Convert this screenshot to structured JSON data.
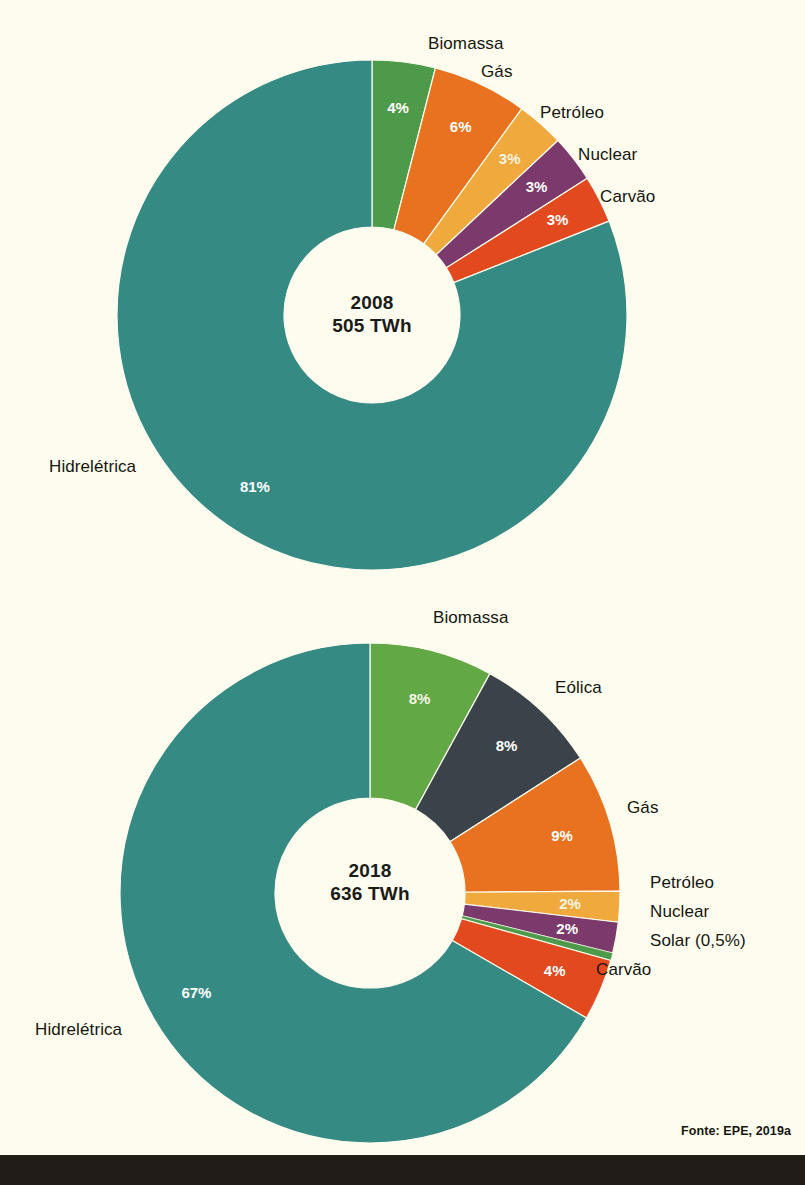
{
  "figure": {
    "background_color": "#fdfcee",
    "bottom_bar_color": "#221c18",
    "source_note": "Fonte: EPE, 2019a"
  },
  "palette": {
    "hidreletrica": "#368a84",
    "biomassa_2008": "#4e9a4b",
    "biomassa_2018": "#62a844",
    "eolica": "#3a424a",
    "gas": "#e8721f",
    "petroleo": "#f0a93c",
    "nuclear": "#7b3a6b",
    "carvao": "#e2491e",
    "solar": "#4e9a4b",
    "label_text": "#16160f",
    "slice_text": "#ffffff",
    "center_text": "#1b1b18"
  },
  "chart_data": [
    {
      "type": "pie",
      "name": "matriz-eletrica-2008",
      "title": "2008",
      "subtitle": "505 TWh",
      "center_lines": [
        "2008",
        "505 TWh"
      ],
      "total_twh": 505,
      "unit": "TWh",
      "donut": true,
      "start_angle_deg": 0,
      "direction": "clockwise",
      "legend": "outside-labels",
      "categories": [
        "Biomassa",
        "Gás",
        "Petróleo",
        "Nuclear",
        "Carvão",
        "Hidrelétrica"
      ],
      "values": [
        4,
        6,
        3,
        3,
        3,
        81
      ],
      "value_labels": [
        "4%",
        "6%",
        "3%",
        "3%",
        "3%",
        "81%"
      ],
      "colors": [
        "#4e9a4b",
        "#e8721f",
        "#f0a93c",
        "#7b3a6b",
        "#e2491e",
        "#368a84"
      ],
      "slices": [
        {
          "label": "Biomassa",
          "value": 4,
          "value_label": "4%",
          "color": "#4e9a4b"
        },
        {
          "label": "Gás",
          "value": 6,
          "value_label": "6%",
          "color": "#e8721f"
        },
        {
          "label": "Petróleo",
          "value": 3,
          "value_label": "3%",
          "color": "#f0a93c"
        },
        {
          "label": "Nuclear",
          "value": 3,
          "value_label": "3%",
          "color": "#7b3a6b"
        },
        {
          "label": "Carvão",
          "value": 3,
          "value_label": "3%",
          "color": "#e2491e"
        },
        {
          "label": "Hidrelétrica",
          "value": 81,
          "value_label": "81%",
          "color": "#368a84"
        }
      ]
    },
    {
      "type": "pie",
      "name": "matriz-eletrica-2018",
      "title": "2018",
      "subtitle": "636 TWh",
      "center_lines": [
        "2018",
        "636 TWh"
      ],
      "total_twh": 636,
      "unit": "TWh",
      "donut": true,
      "start_angle_deg": 0,
      "direction": "clockwise",
      "legend": "outside-labels",
      "categories": [
        "Biomassa",
        "Eólica",
        "Gás",
        "Petróleo",
        "Nuclear",
        "Solar",
        "Carvão",
        "Hidrelétrica"
      ],
      "values": [
        8,
        8,
        9,
        2,
        2,
        0.5,
        4,
        67
      ],
      "value_labels": [
        "8%",
        "8%",
        "9%",
        "2%",
        "2%",
        "",
        "4%",
        "67%"
      ],
      "colors": [
        "#62a844",
        "#3a424a",
        "#e8721f",
        "#f0a93c",
        "#7b3a6b",
        "#4e9a4b",
        "#e2491e",
        "#368a84"
      ],
      "slices": [
        {
          "label": "Biomassa",
          "value": 8,
          "value_label": "8%",
          "color": "#62a844"
        },
        {
          "label": "Eólica",
          "value": 8,
          "value_label": "8%",
          "color": "#3a424a"
        },
        {
          "label": "Gás",
          "value": 9,
          "value_label": "9%",
          "color": "#e8721f"
        },
        {
          "label": "Petróleo",
          "value": 2,
          "value_label": "2%",
          "color": "#f0a93c"
        },
        {
          "label": "Nuclear",
          "value": 2,
          "value_label": "2%",
          "color": "#7b3a6b"
        },
        {
          "label": "Solar (0,5%)",
          "value": 0.5,
          "value_label": "",
          "color": "#4e9a4b"
        },
        {
          "label": "Carvão",
          "value": 4,
          "value_label": "4%",
          "color": "#e2491e"
        },
        {
          "label": "Hidrelétrica",
          "value": 67,
          "value_label": "67%",
          "color": "#368a84"
        }
      ]
    }
  ],
  "chart_2008": {
    "labels": {
      "biomassa": "Biomassa",
      "gas": "Gás",
      "petroleo": "Petróleo",
      "nuclear": "Nuclear",
      "carvao": "Carvão",
      "hidreletrica": "Hidrelétrica"
    },
    "center": {
      "year": "2008",
      "energy": "505 TWh"
    }
  },
  "chart_2018": {
    "labels": {
      "biomassa": "Biomassa",
      "eolica": "Eólica",
      "gas": "Gás",
      "petroleo": "Petróleo",
      "nuclear": "Nuclear",
      "solar": "Solar (0,5%)",
      "carvao": "Carvão",
      "hidreletrica": "Hidrelétrica"
    },
    "center": {
      "year": "2018",
      "energy": "636 TWh"
    }
  }
}
